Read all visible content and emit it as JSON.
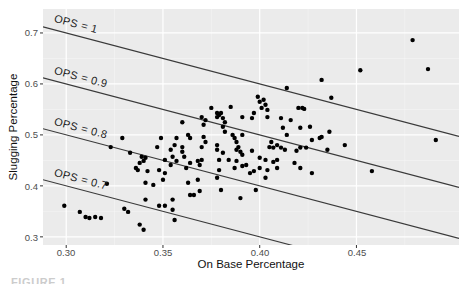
{
  "figure": {
    "caption_fragment": "FIGURE 1.",
    "colors": {
      "panel_bg": "#ebebeb",
      "grid_major": "#ffffff",
      "grid_minor": "#f7f7f7",
      "point": "#000000",
      "reference_line": "#3a3a3a",
      "tick_mark": "#333333",
      "tick_label": "#4d4d4d",
      "axis_title": "#111111"
    }
  },
  "chart_data": {
    "type": "scatter",
    "title": "",
    "xlabel": "On Base Percentage",
    "ylabel": "Slugging Percentage",
    "x_domain": [
      0.288,
      0.503
    ],
    "y_domain": [
      0.284,
      0.747
    ],
    "x_ticks": {
      "labels": [
        "0.30",
        "0.35",
        "0.40",
        "0.45"
      ],
      "values": [
        0.3,
        0.35,
        0.4,
        0.45
      ],
      "minor": [
        0.325,
        0.375,
        0.425,
        0.475
      ]
    },
    "y_ticks": {
      "labels": [
        "0.3",
        "0.4",
        "0.5",
        "0.6",
        "0.7"
      ],
      "values": [
        0.3,
        0.4,
        0.5,
        0.6,
        0.7
      ],
      "minor": [
        0.35,
        0.45,
        0.55,
        0.65
      ]
    },
    "reference_lines": [
      {
        "label": "OPS = 1",
        "ops": 1.0
      },
      {
        "label": "OPS = 0.9",
        "ops": 0.9
      },
      {
        "label": "OPS = 0.8",
        "ops": 0.8
      },
      {
        "label": "OPS = 0.7",
        "ops": 0.7
      }
    ],
    "legend": null,
    "grid": true,
    "points": [
      [
        0.299,
        0.361
      ],
      [
        0.307,
        0.349
      ],
      [
        0.31,
        0.339
      ],
      [
        0.312,
        0.337
      ],
      [
        0.315,
        0.339
      ],
      [
        0.318,
        0.337
      ],
      [
        0.33,
        0.355
      ],
      [
        0.332,
        0.349
      ],
      [
        0.338,
        0.324
      ],
      [
        0.34,
        0.314
      ],
      [
        0.321,
        0.404
      ],
      [
        0.323,
        0.476
      ],
      [
        0.329,
        0.494
      ],
      [
        0.333,
        0.465
      ],
      [
        0.339,
        0.457
      ],
      [
        0.341,
        0.455
      ],
      [
        0.338,
        0.445
      ],
      [
        0.336,
        0.435
      ],
      [
        0.337,
        0.431
      ],
      [
        0.341,
        0.373
      ],
      [
        0.34,
        0.449
      ],
      [
        0.342,
        0.429
      ],
      [
        0.341,
        0.406
      ],
      [
        0.345,
        0.402
      ],
      [
        0.347,
        0.476
      ],
      [
        0.349,
        0.494
      ],
      [
        0.354,
        0.471
      ],
      [
        0.355,
        0.457
      ],
      [
        0.356,
        0.48
      ],
      [
        0.357,
        0.494
      ],
      [
        0.36,
        0.476
      ],
      [
        0.36,
        0.467
      ],
      [
        0.361,
        0.457
      ],
      [
        0.36,
        0.525
      ],
      [
        0.363,
        0.5
      ],
      [
        0.364,
        0.494
      ],
      [
        0.37,
        0.535
      ],
      [
        0.371,
        0.52
      ],
      [
        0.372,
        0.529
      ],
      [
        0.371,
        0.496
      ],
      [
        0.372,
        0.486
      ],
      [
        0.37,
        0.476
      ],
      [
        0.375,
        0.553
      ],
      [
        0.378,
        0.543
      ],
      [
        0.378,
        0.535
      ],
      [
        0.379,
        0.539
      ],
      [
        0.38,
        0.543
      ],
      [
        0.381,
        0.533
      ],
      [
        0.382,
        0.525
      ],
      [
        0.381,
        0.516
      ],
      [
        0.382,
        0.506
      ],
      [
        0.378,
        0.48
      ],
      [
        0.378,
        0.471
      ],
      [
        0.381,
        0.465
      ],
      [
        0.385,
        0.555
      ],
      [
        0.386,
        0.5
      ],
      [
        0.387,
        0.494
      ],
      [
        0.388,
        0.486
      ],
      [
        0.389,
        0.476
      ],
      [
        0.39,
        0.467
      ],
      [
        0.391,
        0.535
      ],
      [
        0.391,
        0.5
      ],
      [
        0.396,
        0.533
      ],
      [
        0.397,
        0.543
      ],
      [
        0.399,
        0.575
      ],
      [
        0.4,
        0.565
      ],
      [
        0.401,
        0.553
      ],
      [
        0.402,
        0.569
      ],
      [
        0.403,
        0.559
      ],
      [
        0.404,
        0.535
      ],
      [
        0.404,
        0.549
      ],
      [
        0.405,
        0.476
      ],
      [
        0.406,
        0.486
      ],
      [
        0.407,
        0.475
      ],
      [
        0.409,
        0.48
      ],
      [
        0.414,
        0.592
      ],
      [
        0.437,
        0.573
      ],
      [
        0.42,
        0.553
      ],
      [
        0.422,
        0.553
      ],
      [
        0.423,
        0.551
      ],
      [
        0.411,
        0.533
      ],
      [
        0.416,
        0.529
      ],
      [
        0.412,
        0.514
      ],
      [
        0.421,
        0.514
      ],
      [
        0.426,
        0.516
      ],
      [
        0.414,
        0.5
      ],
      [
        0.431,
        0.494
      ],
      [
        0.436,
        0.506
      ],
      [
        0.411,
        0.475
      ],
      [
        0.421,
        0.475
      ],
      [
        0.348,
        0.431
      ],
      [
        0.35,
        0.412
      ],
      [
        0.351,
        0.425
      ],
      [
        0.354,
        0.441
      ],
      [
        0.351,
        0.451
      ],
      [
        0.357,
        0.449
      ],
      [
        0.362,
        0.435
      ],
      [
        0.364,
        0.445
      ],
      [
        0.368,
        0.449
      ],
      [
        0.369,
        0.441
      ],
      [
        0.37,
        0.451
      ],
      [
        0.363,
        0.406
      ],
      [
        0.368,
        0.412
      ],
      [
        0.369,
        0.39
      ],
      [
        0.364,
        0.382
      ],
      [
        0.366,
        0.382
      ],
      [
        0.355,
        0.373
      ],
      [
        0.348,
        0.361
      ],
      [
        0.351,
        0.361
      ],
      [
        0.355,
        0.353
      ],
      [
        0.356,
        0.333
      ],
      [
        0.379,
        0.431
      ],
      [
        0.378,
        0.416
      ],
      [
        0.38,
        0.392
      ],
      [
        0.388,
        0.449
      ],
      [
        0.387,
        0.435
      ],
      [
        0.391,
        0.439
      ],
      [
        0.393,
        0.441
      ],
      [
        0.395,
        0.425
      ],
      [
        0.397,
        0.429
      ],
      [
        0.4,
        0.435
      ],
      [
        0.403,
        0.416
      ],
      [
        0.398,
        0.392
      ],
      [
        0.39,
        0.376
      ],
      [
        0.379,
        0.451
      ],
      [
        0.384,
        0.451
      ],
      [
        0.409,
        0.451
      ],
      [
        0.418,
        0.445
      ],
      [
        0.427,
        0.425
      ],
      [
        0.458,
        0.429
      ],
      [
        0.391,
        0.461
      ],
      [
        0.388,
        0.471
      ],
      [
        0.396,
        0.469
      ],
      [
        0.4,
        0.455
      ],
      [
        0.403,
        0.451
      ],
      [
        0.407,
        0.447
      ],
      [
        0.404,
        0.431
      ],
      [
        0.409,
        0.435
      ],
      [
        0.413,
        0.471
      ],
      [
        0.419,
        0.469
      ],
      [
        0.424,
        0.475
      ],
      [
        0.427,
        0.49
      ],
      [
        0.432,
        0.496
      ],
      [
        0.435,
        0.471
      ],
      [
        0.444,
        0.48
      ],
      [
        0.421,
        0.435
      ],
      [
        0.491,
        0.49
      ],
      [
        0.479,
        0.686
      ],
      [
        0.487,
        0.629
      ],
      [
        0.452,
        0.627
      ],
      [
        0.432,
        0.608
      ]
    ]
  }
}
